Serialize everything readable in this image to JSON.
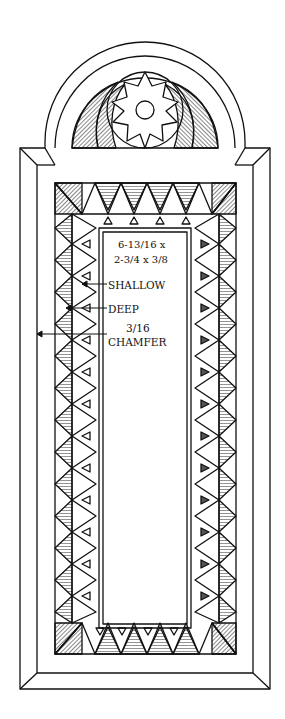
{
  "figure": {
    "dimensions": {
      "line1": "6-13/16 x",
      "line2": "2-3/4 x 3/8"
    },
    "callouts": [
      {
        "label": "SHALLOW"
      },
      {
        "label": "DEEP"
      },
      {
        "label_line1": "3/16",
        "label_line2": "CHAMFER"
      }
    ],
    "colors": {
      "ink": "#111111",
      "paper": "#ffffff"
    }
  }
}
